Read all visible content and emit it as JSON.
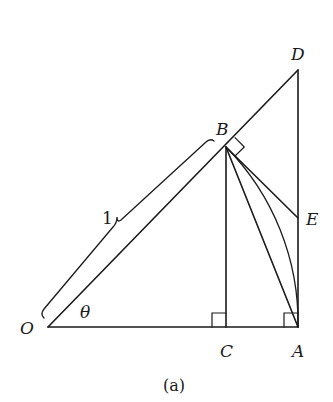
{
  "figure": {
    "caption": "(a)",
    "labels": {
      "O": "O",
      "A": "A",
      "B": "B",
      "C": "C",
      "D": "D",
      "E": "E",
      "theta": "θ",
      "radius": "1"
    },
    "colors": {
      "stroke": "#1a1a1a",
      "background": "#ffffff"
    }
  }
}
